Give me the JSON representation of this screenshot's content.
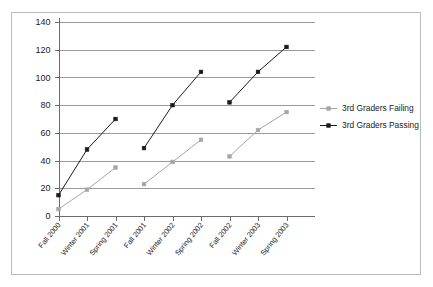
{
  "chart_data": {
    "type": "line",
    "title": "",
    "xlabel": "",
    "ylabel": "",
    "ylim": [
      0,
      140
    ],
    "ytick_labels": [
      "0",
      "20",
      "40",
      "60",
      "80",
      "100",
      "120",
      "140"
    ],
    "yticks": [
      0,
      20,
      40,
      60,
      80,
      100,
      120,
      140
    ],
    "grid": true,
    "legend_position": "right",
    "categories": [
      "Fall 2000",
      "Winter 2001",
      "Spring 2001",
      "Fall 2001",
      "Winter 2002",
      "Spring 2002",
      "Fall 2002",
      "Winter 2003",
      "Spring 2003"
    ],
    "series": [
      {
        "name": "3rd Graders Failing",
        "color": "#a6a6a6",
        "marker": "square",
        "values": [
          5,
          19,
          35,
          23,
          39,
          55,
          43,
          62,
          75
        ],
        "segments": [
          [
            0,
            1,
            2
          ],
          [
            3,
            4,
            5
          ],
          [
            6,
            7,
            8
          ]
        ]
      },
      {
        "name": "3rd Graders Passing",
        "color": "#1a1a1a",
        "marker": "square",
        "values": [
          15,
          48,
          70,
          49,
          80,
          104,
          82,
          104,
          122
        ],
        "segments": [
          [
            0,
            1,
            2
          ],
          [
            3,
            4,
            5
          ],
          [
            6,
            7,
            8
          ]
        ]
      }
    ]
  },
  "legend": {
    "items": [
      {
        "label": "3rd Graders Failing",
        "color": "#a6a6a6"
      },
      {
        "label": "3rd Graders Passing",
        "color": "#1a1a1a"
      }
    ]
  },
  "colors": {
    "failing": "#a6a6a6",
    "passing": "#1a1a1a",
    "gridline": "#9a9a9a",
    "axis": "#6b6b6b",
    "frame": "#b9b9b9",
    "background": "#ffffff"
  }
}
